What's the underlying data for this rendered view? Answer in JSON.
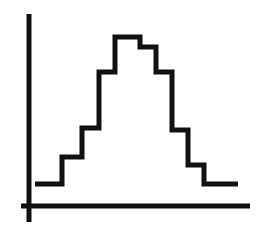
{
  "figure": {
    "title": "",
    "background_color": "#ffffff",
    "ink_color": "#111111",
    "width": 271,
    "height": 231
  },
  "axes": {
    "x_axis": {
      "name": "x-axis",
      "label": "",
      "x_start": 21,
      "x_end": 250,
      "y": 206,
      "stroke_width": 5
    },
    "y_axis": {
      "name": "y-axis",
      "label": "",
      "x": 29,
      "y_start": 14,
      "y_end": 222,
      "stroke_width": 5
    },
    "tick_labels_x": [],
    "tick_labels_y": [],
    "grid": false
  },
  "chart_data": {
    "type": "bar",
    "title": "",
    "subtitle": "",
    "xlabel": "",
    "ylabel": "",
    "grid": false,
    "legend": [],
    "legend_position": "none",
    "render_style": "step-outline",
    "baseline_y_px": 206,
    "stroke_width_px": 5,
    "stroke_color": "#111111",
    "categories": [
      "1",
      "2",
      "3",
      "4",
      "5",
      "6",
      "7",
      "8",
      "9",
      "10"
    ],
    "values": [
      22,
      49,
      78,
      134,
      169,
      159,
      134,
      76,
      41,
      22
    ],
    "ylim": [
      0,
      180
    ],
    "xlim": [
      0,
      10
    ],
    "bin_edges_px": [
      35,
      62,
      82,
      99,
      115,
      140,
      156,
      172,
      188,
      204,
      238
    ],
    "bin_tops_px": [
      184,
      157,
      128,
      72,
      37,
      47,
      72,
      130,
      165,
      184
    ],
    "annotations": []
  }
}
